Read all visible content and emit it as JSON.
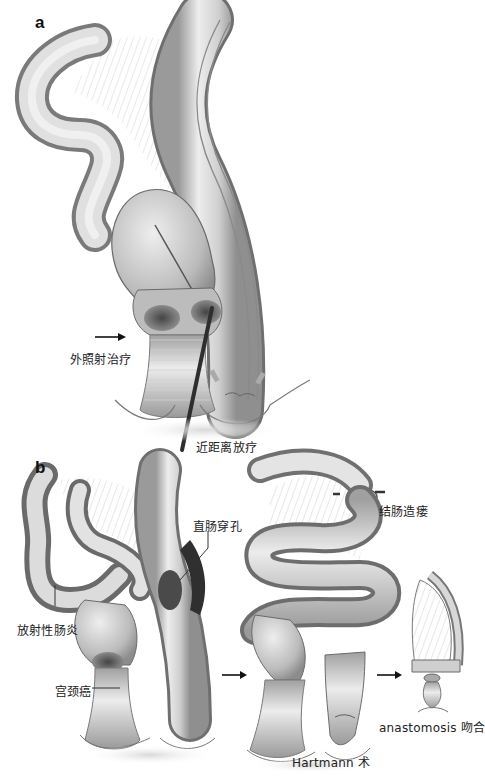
{
  "figure": {
    "panels": [
      {
        "id": "a",
        "label": "a",
        "annotations": [
          {
            "id": "external-beam",
            "text": "外照射治疗",
            "pointer": "arrow"
          },
          {
            "id": "brachytherapy",
            "text": "近距离放疗",
            "pointer": "applicator-rod"
          }
        ]
      },
      {
        "id": "b",
        "label": "b",
        "annotations": [
          {
            "id": "rectal-perforation",
            "text": "直肠穿孔",
            "pointer": "leader-line"
          },
          {
            "id": "radiation-enteritis",
            "text": "放射性肠炎",
            "pointer": "leader-line"
          },
          {
            "id": "cervical-cancer",
            "text": "宫颈癌",
            "pointer": "leader-line"
          },
          {
            "id": "colostomy",
            "text": "结肠造瘘",
            "pointer": "none"
          },
          {
            "id": "hartmann",
            "text": "Hartmann 术",
            "pointer": "none"
          },
          {
            "id": "anastomosis",
            "text": "anastomosis 吻合",
            "pointer": "none"
          }
        ]
      }
    ],
    "colors": {
      "background": "#ffffff",
      "tissue_light": "#e6e6e6",
      "tissue_mid": "#bdbdbd",
      "tissue_dark": "#6e6e6e",
      "lesion": "#3a3a3a",
      "outline": "#555555",
      "text": "#222222"
    }
  }
}
